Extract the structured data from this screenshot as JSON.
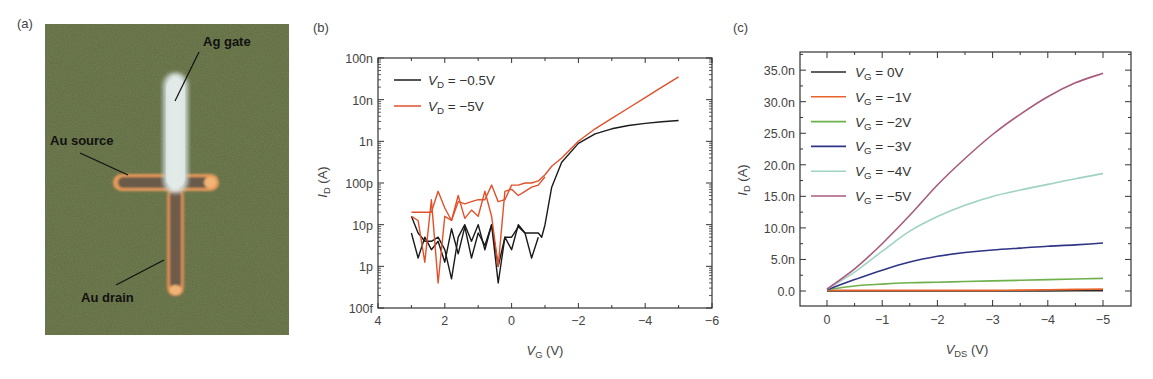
{
  "figure": {
    "panels": [
      {
        "id": "a",
        "label": "(a)",
        "type": "photo",
        "annotations": [
          {
            "text": "Ag gate"
          },
          {
            "text": "Au source"
          },
          {
            "text": "Au drain"
          }
        ]
      },
      {
        "id": "b",
        "label": "(b)"
      },
      {
        "id": "c",
        "label": "(c)"
      }
    ]
  },
  "colors": {
    "photo_bg": "#5f6b40",
    "gate": "#dde6e4",
    "electrode_edge": "#e8a060",
    "electrode_body": "#6a5a48",
    "black_series": "#1a1a1a",
    "red_series": "#e2502a",
    "vg0": "#2b2b2b",
    "vg1": "#e8622a",
    "vg2": "#6db04c",
    "vg3": "#2f3486",
    "vg4": "#9fd2c4",
    "vg5": "#a85a7c"
  },
  "chart_data": [
    {
      "panel": "b",
      "type": "line",
      "title": "",
      "xlabel": "V_G (V)",
      "xlabel_main": "V",
      "xlabel_sub": "G",
      "xlabel_unit": " (V)",
      "ylabel": "I_D (A)",
      "ylabel_main": "I",
      "ylabel_sub": "D",
      "ylabel_unit": " (A)",
      "yscale": "log",
      "xlim": [
        4,
        -6
      ],
      "ylim": [
        1e-13,
        1e-07
      ],
      "xticks": [
        4,
        2,
        0,
        -2,
        -4,
        -6
      ],
      "xtick_labels": [
        "4",
        "2",
        "0",
        "−2",
        "−4",
        "−6"
      ],
      "yticks": [
        "100n",
        "10n",
        "1n",
        "100p",
        "10p",
        "1p",
        "100f"
      ],
      "legend": [
        {
          "main": "V",
          "sub": "D",
          "value": " = −0.5V",
          "name": "V_D = -0.5V"
        },
        {
          "main": "V",
          "sub": "D",
          "value": " = −5V",
          "name": "V_D = -5V"
        }
      ],
      "legend_position": "upper left",
      "grid": false,
      "series": [
        {
          "name": "V_D = -0.5V (forward)",
          "color": "black",
          "x": [
            3.0,
            2.8,
            2.6,
            2.4,
            2.2,
            2.0,
            1.8,
            1.6,
            1.4,
            1.2,
            1.0,
            0.8,
            0.6,
            0.4,
            0.2,
            0.0,
            -0.2,
            -0.4,
            -0.6,
            -0.8,
            -0.9,
            -1.0,
            -1.2,
            -1.5,
            -2.0,
            -2.5,
            -3.0,
            -3.5,
            -4.0,
            -4.5,
            -5.0
          ],
          "log10_I": [
            -11.2,
            -11.8,
            -11.3,
            -11.6,
            -11.4,
            -11.9,
            -11.1,
            -11.7,
            -11.05,
            -11.8,
            -11.2,
            -11.5,
            -11.0,
            -12.0,
            -11.3,
            -11.3,
            -11.05,
            -11.2,
            -11.2,
            -11.2,
            -11.3,
            -11.0,
            -10.1,
            -9.5,
            -9.05,
            -8.82,
            -8.7,
            -8.62,
            -8.57,
            -8.53,
            -8.5
          ]
        },
        {
          "name": "V_D = -0.5V (reverse)",
          "color": "black",
          "x": [
            3.0,
            2.8,
            2.6,
            2.4,
            2.2,
            2.0,
            1.8,
            1.6,
            1.4,
            1.2,
            1.0,
            0.8,
            0.6,
            0.4,
            0.2,
            0.0,
            -0.2,
            -0.4,
            -0.6,
            -0.8
          ],
          "log10_I": [
            -10.8,
            -11.2,
            -11.4,
            -11.4,
            -11.3,
            -11.6,
            -12.3,
            -11.3,
            -11.0,
            -11.4,
            -11.0,
            -11.6,
            -11.0,
            -12.4,
            -11.3,
            -11.6,
            -11.0,
            -11.2,
            -11.8,
            -11.3
          ]
        },
        {
          "name": "V_D = -5V (forward)",
          "color": "red",
          "x": [
            3.0,
            2.8,
            2.6,
            2.4,
            2.2,
            2.0,
            1.8,
            1.6,
            1.4,
            1.2,
            1.0,
            0.8,
            0.6,
            0.4,
            0.2,
            0.0,
            -0.2,
            -0.4,
            -0.6,
            -0.8,
            -1.0,
            -1.2,
            -1.5,
            -2.0,
            -2.5,
            -3.0,
            -3.5,
            -4.0,
            -4.5,
            -5.0
          ],
          "log10_I": [
            -10.7,
            -10.7,
            -10.7,
            -10.7,
            -10.2,
            -10.6,
            -10.9,
            -10.45,
            -10.5,
            -10.45,
            -10.4,
            -10.4,
            -10.05,
            -10.45,
            -10.4,
            -10.05,
            -10.05,
            -10.0,
            -10.0,
            -9.95,
            -9.8,
            -9.6,
            -9.4,
            -9.0,
            -8.7,
            -8.45,
            -8.2,
            -7.95,
            -7.7,
            -7.45
          ]
        },
        {
          "name": "V_D = -5V (reverse)",
          "color": "red",
          "x": [
            3.0,
            2.8,
            2.6,
            2.4,
            2.2,
            2.0,
            1.8,
            1.6,
            1.4,
            1.2,
            1.0,
            0.8,
            0.6,
            0.4,
            0.2,
            0.0,
            -0.2,
            -0.4,
            -0.6,
            -0.8,
            -1.0
          ],
          "log10_I": [
            -10.8,
            -10.9,
            -11.9,
            -10.4,
            -12.4,
            -10.8,
            -10.9,
            -10.3,
            -10.85,
            -10.65,
            -10.8,
            -10.2,
            -10.8,
            -12.0,
            -10.2,
            -10.15,
            -10.3,
            -10.2,
            -10.1,
            -10.05,
            -9.85
          ]
        }
      ]
    },
    {
      "panel": "c",
      "type": "line",
      "title": "",
      "xlabel": "V_DS (V)",
      "xlabel_main": "V",
      "xlabel_sub": "DS",
      "xlabel_unit": " (V)",
      "ylabel": "I_D (A)",
      "ylabel_main": "I",
      "ylabel_sub": "D",
      "ylabel_unit": " (A)",
      "xlim": [
        0.5,
        -5.5
      ],
      "ylim": [
        -2.4,
        37.8
      ],
      "xticks": [
        0,
        -1,
        -2,
        -3,
        -4,
        -5
      ],
      "xtick_labels": [
        "0",
        "−1",
        "−2",
        "−3",
        "−4",
        "−5"
      ],
      "yticks": [
        0,
        5,
        10,
        15,
        20,
        25,
        30,
        35
      ],
      "ytick_labels": [
        "0.0",
        "5.0n",
        "10.0n",
        "15.0n",
        "20.0n",
        "25.0n",
        "30.0n",
        "35.0n"
      ],
      "legend_position": "upper left",
      "grid": false,
      "x": [
        0,
        -0.5,
        -1.0,
        -1.5,
        -2.0,
        -2.5,
        -3.0,
        -3.5,
        -4.0,
        -4.5,
        -5.0
      ],
      "series": [
        {
          "name": "V_G = 0V",
          "main": "V",
          "sub": "G",
          "value": " = 0V",
          "color_key": "vg0",
          "values_nA": [
            0.0,
            0.0,
            0.0,
            0.0,
            0.0,
            0.0,
            0.0,
            0.0,
            0.0,
            0.03,
            0.05
          ]
        },
        {
          "name": "V_G = -1V",
          "main": "V",
          "sub": "G",
          "value": " = −1V",
          "color_key": "vg1",
          "values_nA": [
            0.1,
            0.1,
            0.1,
            0.1,
            0.1,
            0.1,
            0.1,
            0.15,
            0.2,
            0.25,
            0.3
          ]
        },
        {
          "name": "V_G = -2V",
          "main": "V",
          "sub": "G",
          "value": " = −2V",
          "color_key": "vg2",
          "values_nA": [
            0.2,
            0.8,
            1.1,
            1.3,
            1.4,
            1.5,
            1.6,
            1.7,
            1.8,
            1.9,
            2.0
          ]
        },
        {
          "name": "V_G = -3V",
          "main": "V",
          "sub": "G",
          "value": " = −3V",
          "color_key": "vg3",
          "values_nA": [
            0.2,
            1.8,
            3.3,
            4.6,
            5.5,
            6.1,
            6.5,
            6.8,
            7.1,
            7.3,
            7.6
          ]
        },
        {
          "name": "V_G = -4V",
          "main": "V",
          "sub": "G",
          "value": " = −4V",
          "color_key": "vg4",
          "values_nA": [
            0.3,
            3.0,
            6.3,
            9.5,
            11.8,
            13.6,
            15.0,
            16.0,
            16.9,
            17.8,
            18.6
          ]
        },
        {
          "name": "V_G = -5V",
          "main": "V",
          "sub": "G",
          "value": " = −5V",
          "color_key": "vg5",
          "values_nA": [
            0.3,
            3.5,
            7.5,
            12.0,
            16.8,
            21.0,
            24.8,
            28.0,
            30.8,
            33.0,
            34.5
          ]
        }
      ]
    }
  ]
}
